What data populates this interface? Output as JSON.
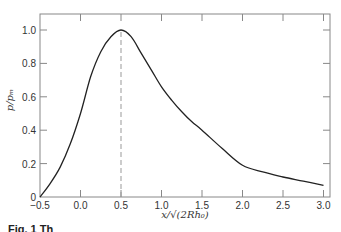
{
  "chart_data": {
    "type": "line",
    "title": "",
    "xlabel": "x/√(2Rh₀)",
    "ylabel": "p/pₘ",
    "xlim": [
      -0.5,
      3.0
    ],
    "ylim": [
      0,
      1.08
    ],
    "x_ticks": [
      -0.5,
      0.0,
      0.5,
      1.0,
      1.5,
      2.0,
      2.5,
      3.0
    ],
    "x_tick_labels": [
      "−0.5",
      "0.0",
      "0.5",
      "1.0",
      "1.5",
      "2.0",
      "2.5",
      "3.0"
    ],
    "y_ticks": [
      0,
      0.2,
      0.4,
      0.6,
      0.8,
      1.0
    ],
    "y_tick_labels": [
      "0",
      "0.2",
      "0.4",
      "0.6",
      "0.8",
      "1.0"
    ],
    "grid": false,
    "legend": null,
    "series": [
      {
        "name": "p/pm",
        "x": [
          -0.5,
          -0.375,
          -0.25,
          -0.125,
          0.0,
          0.125,
          0.25,
          0.375,
          0.5,
          0.625,
          0.75,
          0.875,
          1.0,
          1.125,
          1.25,
          1.375,
          1.5,
          1.75,
          2.0,
          2.25,
          2.5,
          2.75,
          3.0
        ],
        "values": [
          0.0,
          0.08,
          0.18,
          0.32,
          0.5,
          0.72,
          0.87,
          0.96,
          1.0,
          0.96,
          0.86,
          0.76,
          0.66,
          0.58,
          0.51,
          0.45,
          0.4,
          0.29,
          0.19,
          0.15,
          0.12,
          0.095,
          0.07
        ]
      }
    ],
    "annotations": [
      {
        "type": "vertical-dashed-line",
        "x": 0.5,
        "y_from": 0,
        "y_to": 1.0
      }
    ]
  },
  "caption": "Fig. 1  Th",
  "colors": {
    "curve": "#222222",
    "axes": "#888888",
    "dashed": "#999999"
  }
}
